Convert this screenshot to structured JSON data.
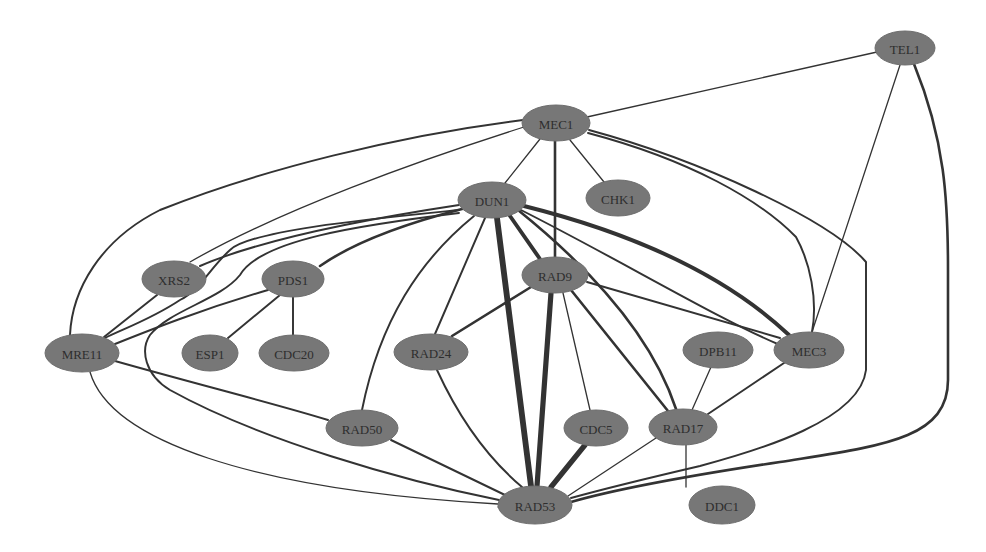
{
  "diagram": {
    "type": "protein-interaction-network",
    "node_color": "#777777",
    "edge_color": "#333333",
    "background": "#ffffff",
    "nodes": [
      {
        "id": "TEL1",
        "label": "TEL1",
        "x": 905,
        "y": 48,
        "rx": 30,
        "ry": 17
      },
      {
        "id": "MEC1",
        "label": "MEC1",
        "x": 556,
        "y": 123,
        "rx": 34,
        "ry": 18
      },
      {
        "id": "DUN1",
        "label": "DUN1",
        "x": 492,
        "y": 200,
        "rx": 34,
        "ry": 18
      },
      {
        "id": "CHK1",
        "label": "CHK1",
        "x": 618,
        "y": 198,
        "rx": 32,
        "ry": 18
      },
      {
        "id": "XRS2",
        "label": "XRS2",
        "x": 174,
        "y": 279,
        "rx": 32,
        "ry": 18
      },
      {
        "id": "PDS1",
        "label": "PDS1",
        "x": 293,
        "y": 279,
        "rx": 31,
        "ry": 18
      },
      {
        "id": "RAD9",
        "label": "RAD9",
        "x": 555,
        "y": 275,
        "rx": 33,
        "ry": 18
      },
      {
        "id": "MRE11",
        "label": "MRE11",
        "x": 82,
        "y": 353,
        "rx": 37,
        "ry": 19
      },
      {
        "id": "ESP1",
        "label": "ESP1",
        "x": 210,
        "y": 353,
        "rx": 28,
        "ry": 18
      },
      {
        "id": "CDC20",
        "label": "CDC20",
        "x": 294,
        "y": 353,
        "rx": 35,
        "ry": 18
      },
      {
        "id": "RAD24",
        "label": "RAD24",
        "x": 431,
        "y": 352,
        "rx": 37,
        "ry": 18
      },
      {
        "id": "DPB11",
        "label": "DPB11",
        "x": 718,
        "y": 350,
        "rx": 35,
        "ry": 18
      },
      {
        "id": "MEC3",
        "label": "MEC3",
        "x": 809,
        "y": 350,
        "rx": 35,
        "ry": 18
      },
      {
        "id": "RAD50",
        "label": "RAD50",
        "x": 362,
        "y": 428,
        "rx": 36,
        "ry": 18
      },
      {
        "id": "CDC5",
        "label": "CDC5",
        "x": 596,
        "y": 428,
        "rx": 32,
        "ry": 18
      },
      {
        "id": "RAD17",
        "label": "RAD17",
        "x": 683,
        "y": 427,
        "rx": 34,
        "ry": 18
      },
      {
        "id": "RAD53",
        "label": "RAD53",
        "x": 535,
        "y": 505,
        "rx": 37,
        "ry": 19
      },
      {
        "id": "DDC1",
        "label": "DDC1",
        "x": 722,
        "y": 505,
        "rx": 33,
        "ry": 19
      }
    ],
    "edges": [
      {
        "source": "MEC1",
        "target": "TEL1",
        "weight": 1,
        "path": "M587,117 L877,52"
      },
      {
        "source": "TEL1",
        "target": "MEC3",
        "weight": 1,
        "path": "M900,65 L812,332"
      },
      {
        "source": "TEL1",
        "target": "RAD53",
        "weight": 2,
        "path": "M914,64 C945,140 948,200 948,270 L948,380 C948,440 880,446 780,462 C700,474 620,488 571,502"
      },
      {
        "source": "MEC1",
        "target": "RAD53",
        "weight": 1.5,
        "path": "M589,130 C700,160 830,220 866,262 L866,370 C860,420 760,450 700,466 C640,480 600,490 571,498"
      },
      {
        "source": "MEC1",
        "target": "DUN1",
        "weight": 1,
        "path": "M540,139 L505,183"
      },
      {
        "source": "MEC1",
        "target": "CHK1",
        "weight": 1,
        "path": "M570,140 L604,182"
      },
      {
        "source": "MEC1",
        "target": "RAD9",
        "weight": 2,
        "path": "M555,141 L555,257"
      },
      {
        "source": "MEC1",
        "target": "MRE11",
        "weight": 1.5,
        "path": "M523,120 C400,135 260,170 160,210 C100,240 72,290 70,335"
      },
      {
        "source": "MEC1",
        "target": "XRS2",
        "weight": 1,
        "path": "M524,127 C420,160 280,210 190,262"
      },
      {
        "source": "MEC1",
        "target": "MEC3",
        "weight": 1.5,
        "path": "M588,133 C690,160 760,200 796,237 C810,262 818,300 812,332"
      },
      {
        "source": "DUN1",
        "target": "XRS2",
        "weight": 1.5,
        "path": "M459,205 C360,220 260,240 200,266"
      },
      {
        "source": "DUN1",
        "target": "PDS1",
        "weight": 2,
        "path": "M462,209 C400,225 350,245 320,266"
      },
      {
        "source": "DUN1",
        "target": "MRE11",
        "weight": 1.5,
        "path": "M459,210 C380,218 250,230 230,250 C210,268 200,290 180,300 C150,320 120,330 105,338"
      },
      {
        "source": "DUN1",
        "target": "RAD53",
        "weight": 1.5,
        "path": "M459,213 C360,225 260,240 240,275 C220,300 170,310 150,335 C140,350 145,375 170,390 C260,440 400,480 499,500"
      },
      {
        "source": "DUN1",
        "target": "RAD50",
        "weight": 1.5,
        "path": "M474,216 C420,260 380,320 362,410"
      },
      {
        "source": "DUN1",
        "target": "RAD24",
        "weight": 1.5,
        "path": "M485,218 L435,334"
      },
      {
        "source": "DUN1",
        "target": "RAD53",
        "weight": 4.5,
        "path": "M497,218 L531,486"
      },
      {
        "source": "DUN1",
        "target": "RAD9",
        "weight": 3,
        "path": "M510,216 L540,259"
      },
      {
        "source": "DUN1",
        "target": "RAD17",
        "weight": 2,
        "path": "M518,210 C580,260 650,330 676,409"
      },
      {
        "source": "DUN1",
        "target": "MEC3",
        "weight": 3,
        "path": "M524,206 C620,230 720,270 789,335"
      },
      {
        "source": "DUN1",
        "target": "RAD53R",
        "weight": 1.5,
        "path": "M521,210 C620,260 720,320 780,345"
      },
      {
        "source": "XRS2",
        "target": "MRE11",
        "weight": 1.5,
        "path": "M157,295 L104,337"
      },
      {
        "source": "PDS1",
        "target": "MRE11",
        "weight": 1.5,
        "path": "M268,290 C200,310 150,330 115,344"
      },
      {
        "source": "PDS1",
        "target": "ESP1",
        "weight": 1.5,
        "path": "M280,295 L228,338"
      },
      {
        "source": "PDS1",
        "target": "CDC20",
        "weight": 1.5,
        "path": "M293,297 L293,335"
      },
      {
        "source": "MRE11",
        "target": "RAD50",
        "weight": 1.5,
        "path": "M115,361 C200,385 280,405 328,420"
      },
      {
        "source": "MRE11",
        "target": "RAD53",
        "weight": 1,
        "path": "M90,372 C110,440 250,490 498,504"
      },
      {
        "source": "RAD50",
        "target": "RAD53",
        "weight": 1.5,
        "path": "M391,440 L505,495"
      },
      {
        "source": "RAD24",
        "target": "RAD9",
        "weight": 2,
        "path": "M452,336 L531,287"
      },
      {
        "source": "RAD24",
        "target": "RAD53",
        "weight": 1.5,
        "path": "M437,370 C460,420 490,460 522,487"
      },
      {
        "source": "RAD9",
        "target": "RAD53",
        "weight": 4,
        "path": "M551,293 L537,486"
      },
      {
        "source": "RAD9",
        "target": "CDC5",
        "weight": 1,
        "path": "M563,293 L590,410"
      },
      {
        "source": "RAD9",
        "target": "RAD17",
        "weight": 2,
        "path": "M571,290 L668,411"
      },
      {
        "source": "RAD9",
        "target": "MEC3",
        "weight": 1.5,
        "path": "M587,282 L780,338"
      },
      {
        "source": "CDC5",
        "target": "RAD53",
        "weight": 4,
        "path": "M585,445 L551,487"
      },
      {
        "source": "RAD17",
        "target": "RAD53",
        "weight": 1,
        "path": "M656,438 L568,496"
      },
      {
        "source": "RAD17",
        "target": "DDC1",
        "weight": 1,
        "path": "M686,445 L686,460 L686,487"
      },
      {
        "source": "DPB11",
        "target": "RAD17",
        "weight": 1,
        "path": "M711,367 L692,410"
      },
      {
        "source": "MEC3",
        "target": "RAD17",
        "weight": 1.5,
        "path": "M784,363 L708,414"
      },
      {
        "source": "RAD53",
        "target": "MRE11_far",
        "weight": 1,
        "path": "M498,507 L498,507"
      }
    ]
  }
}
